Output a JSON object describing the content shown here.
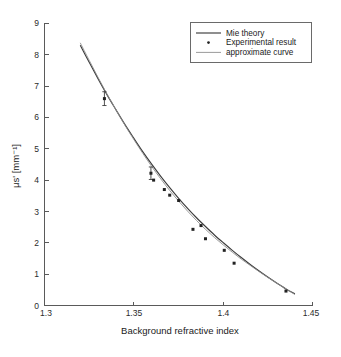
{
  "figure": {
    "background_color": "#ffffff",
    "width": 341,
    "height": 357
  },
  "axes": {
    "x_title": "Background refractive index",
    "y_title": "μs' [mm⁻¹]",
    "x_ticks": [
      "1.3",
      "1.35",
      "1.4",
      "1.45"
    ],
    "y_ticks": [
      "0",
      "1",
      "2",
      "3",
      "4",
      "5",
      "6",
      "7",
      "8",
      "9"
    ],
    "axis_color": "#5a5a5a"
  },
  "legend": {
    "entries": [
      {
        "label": "Mie theory",
        "marker": "solid-line",
        "color": "#3c3c3c"
      },
      {
        "label": "Experimental result",
        "marker": "dot",
        "color": "#222222"
      },
      {
        "label": "approximate curve",
        "marker": "thin-line",
        "color": "#8e8e8e"
      }
    ]
  },
  "chart_data": {
    "type": "line",
    "title": "",
    "xlabel": "Background refractive index",
    "ylabel": "μs' [mm⁻¹]",
    "xlim": [
      1.3,
      1.45
    ],
    "ylim": [
      0,
      9
    ],
    "xticks": [
      1.3,
      1.35,
      1.4,
      1.45
    ],
    "yticks": [
      0,
      1,
      2,
      3,
      4,
      5,
      6,
      7,
      8,
      9
    ],
    "grid": false,
    "legend_position": "top-right",
    "series": [
      {
        "name": "Mie theory",
        "type": "line",
        "style": "solid",
        "color": "#3c3c3c",
        "x": [
          1.32,
          1.325,
          1.33,
          1.335,
          1.34,
          1.345,
          1.35,
          1.355,
          1.36,
          1.365,
          1.37,
          1.375,
          1.38,
          1.385,
          1.39,
          1.395,
          1.4,
          1.405,
          1.41,
          1.415,
          1.42,
          1.425,
          1.43,
          1.435,
          1.44
        ],
        "y": [
          8.3,
          7.76,
          7.23,
          6.72,
          6.24,
          5.77,
          5.33,
          4.9,
          4.5,
          4.12,
          3.76,
          3.42,
          3.1,
          2.8,
          2.52,
          2.25,
          2.0,
          1.76,
          1.53,
          1.31,
          1.1,
          0.9,
          0.71,
          0.53,
          0.37
        ]
      },
      {
        "name": "approximate curve",
        "type": "line",
        "style": "thin-solid",
        "color": "#8e8e8e",
        "x": [
          1.32,
          1.325,
          1.33,
          1.335,
          1.34,
          1.345,
          1.35,
          1.355,
          1.36,
          1.365,
          1.37,
          1.375,
          1.38,
          1.385,
          1.39,
          1.395,
          1.4,
          1.405,
          1.41,
          1.415,
          1.42,
          1.425,
          1.43,
          1.435,
          1.44
        ],
        "y": [
          8.38,
          7.82,
          7.27,
          6.74,
          6.24,
          5.75,
          5.29,
          4.85,
          4.43,
          4.04,
          3.67,
          3.33,
          3.01,
          2.71,
          2.43,
          2.17,
          1.93,
          1.7,
          1.48,
          1.28,
          1.08,
          0.89,
          0.71,
          0.53,
          0.35
        ]
      },
      {
        "name": "Experimental result",
        "type": "scatter",
        "color": "#222222",
        "points": [
          {
            "x": 1.3335,
            "y": 6.6,
            "yerr": 0.22
          },
          {
            "x": 1.3595,
            "y": 4.22,
            "yerr": 0.2
          },
          {
            "x": 1.361,
            "y": 4.0,
            "yerr": 0.0
          },
          {
            "x": 1.367,
            "y": 3.7,
            "yerr": 0.0
          },
          {
            "x": 1.37,
            "y": 3.52,
            "yerr": 0.0
          },
          {
            "x": 1.375,
            "y": 3.35,
            "yerr": 0.0
          },
          {
            "x": 1.383,
            "y": 2.43,
            "yerr": 0.0
          },
          {
            "x": 1.3875,
            "y": 2.55,
            "yerr": 0.0
          },
          {
            "x": 1.39,
            "y": 2.13,
            "yerr": 0.0
          },
          {
            "x": 1.4005,
            "y": 1.76,
            "yerr": 0.0
          },
          {
            "x": 1.406,
            "y": 1.35,
            "yerr": 0.0
          },
          {
            "x": 1.435,
            "y": 0.46,
            "yerr": 0.0
          }
        ]
      }
    ]
  }
}
